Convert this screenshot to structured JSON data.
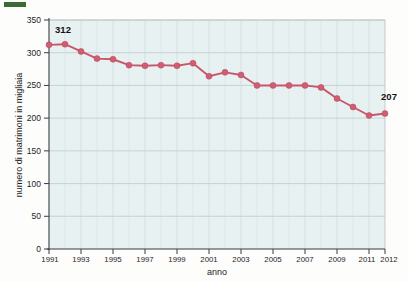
{
  "chart_data": {
    "type": "line",
    "title": "",
    "xlabel": "anno",
    "ylabel": "numero di matrimoni in migliaia",
    "ylim": [
      0,
      350
    ],
    "ytick_values": [
      0,
      50,
      100,
      150,
      200,
      250,
      300,
      350
    ],
    "ytick_labels": [
      "0",
      "50",
      "100",
      "150",
      "200",
      "250",
      "300",
      "350"
    ],
    "xlim": [
      1991,
      2012
    ],
    "xtick_values": [
      1991,
      1993,
      1995,
      1997,
      1999,
      2001,
      2003,
      2005,
      2007,
      2009,
      2011,
      2012
    ],
    "xtick_labels": [
      "1991",
      "1993",
      "1995",
      "1997",
      "1999",
      "2001",
      "2003",
      "2005",
      "2007",
      "2009",
      "2011",
      "2012"
    ],
    "grid": true,
    "legend": "none",
    "series_color": "#cf5e71",
    "x": [
      1991,
      1992,
      1993,
      1994,
      1995,
      1996,
      1997,
      1998,
      1999,
      2000,
      2001,
      2002,
      2003,
      2004,
      2005,
      2006,
      2007,
      2008,
      2009,
      2010,
      2011,
      2012
    ],
    "values": [
      312,
      313,
      302,
      291,
      290,
      281,
      280,
      281,
      280,
      284,
      264,
      270,
      266,
      250,
      250,
      250,
      250,
      247,
      230,
      217,
      204,
      207
    ],
    "annotations": [
      {
        "x": 1991,
        "y": 312,
        "text": "312",
        "position": "above"
      },
      {
        "x": 2012,
        "y": 207,
        "text": "207",
        "position": "above-right"
      }
    ]
  },
  "figure": {
    "background": "#fdfdfc",
    "plot_background": "#e7f1f1",
    "axis_color": "#3b3b3b",
    "grid_color": "#aebfc4"
  }
}
